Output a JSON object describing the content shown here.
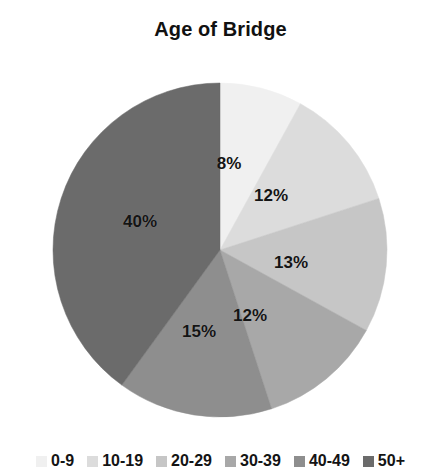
{
  "chart_data": {
    "type": "pie",
    "title": "Age of Bridge",
    "xlabel": "",
    "ylabel": "",
    "legend_position": "bottom",
    "grid": false,
    "start_angle_deg": 0,
    "direction": "clockwise",
    "categories": [
      "0-9",
      "10-19",
      "20-29",
      "30-39",
      "40-49",
      "50+"
    ],
    "values": [
      8,
      12,
      13,
      12,
      15,
      40
    ],
    "value_labels": [
      "8%",
      "12%",
      "13%",
      "12%",
      "15%",
      "40%"
    ],
    "colors": [
      "#f0f0f0",
      "#dcdcdc",
      "#c6c6c6",
      "#a8a8a8",
      "#8e8e8e",
      "#6b6b6b"
    ],
    "slices": [
      {
        "name": "0-9",
        "value": 8,
        "label": "8%",
        "color": "#f0f0f0",
        "label_x": 229,
        "label_y": 164
      },
      {
        "name": "10-19",
        "value": 12,
        "label": "12%",
        "color": "#dcdcdc",
        "label_x": 271,
        "label_y": 196
      },
      {
        "name": "20-29",
        "value": 13,
        "label": "13%",
        "color": "#c6c6c6",
        "label_x": 291,
        "label_y": 263
      },
      {
        "name": "30-39",
        "value": 12,
        "label": "12%",
        "color": "#a8a8a8",
        "label_x": 250,
        "label_y": 316
      },
      {
        "name": "40-49",
        "value": 15,
        "label": "15%",
        "color": "#8e8e8e",
        "label_x": 199,
        "label_y": 332
      },
      {
        "name": "50+",
        "value": 40,
        "label": "40%",
        "color": "#6b6b6b",
        "label_x": 140,
        "label_y": 222
      }
    ]
  },
  "legend": {
    "items": [
      {
        "label": "0-9",
        "color": "#f0f0f0"
      },
      {
        "label": "10-19",
        "color": "#dcdcdc"
      },
      {
        "label": "20-29",
        "color": "#c6c6c6"
      },
      {
        "label": "30-39",
        "color": "#a8a8a8"
      },
      {
        "label": "40-49",
        "color": "#8e8e8e"
      },
      {
        "label": "50+",
        "color": "#6b6b6b"
      }
    ]
  },
  "geometry": {
    "center_x": 220,
    "center_y": 250,
    "radius": 167
  }
}
